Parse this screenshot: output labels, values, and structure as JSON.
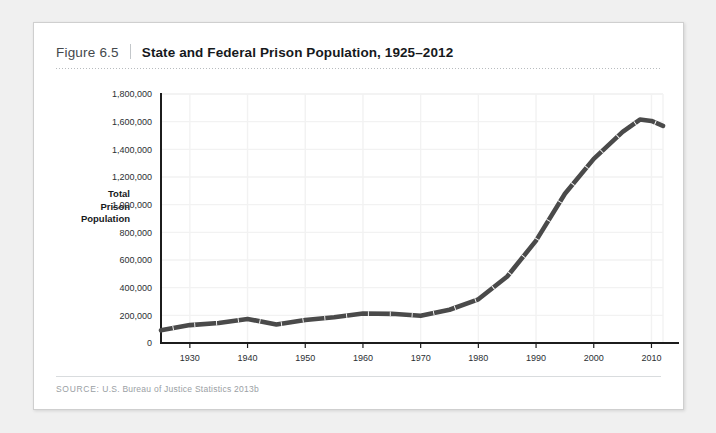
{
  "figure": {
    "number": "Figure 6.5",
    "title": "State and Federal Prison Population, 1925–2012",
    "source_label": "SOURCE:",
    "source_text": " U.S. Bureau of Justice Statistics 2013b"
  },
  "colors": {
    "line": "#4a4a4a",
    "axis": "#1c1c1c",
    "gridline": "#f2f2f2",
    "card_bg": "#ffffff",
    "page_bg": "#f0f0f0",
    "title_text": "#16191c",
    "figure_number_text": "#44484c",
    "source_text": "#9aa0a4"
  },
  "chart_data": {
    "type": "line",
    "title": "State and Federal Prison Population, 1925–2012",
    "xlabel": "",
    "ylabel": "Total Prison Population",
    "xlim": [
      1925,
      2012
    ],
    "ylim": [
      0,
      1800000
    ],
    "grid": true,
    "legend": "none",
    "xticks": [
      1930,
      1940,
      1950,
      1960,
      1970,
      1980,
      1990,
      2000,
      2010
    ],
    "xtick_labels": [
      "1930",
      "1940",
      "1950",
      "1960",
      "1970",
      "1980",
      "1990",
      "2000",
      "2010"
    ],
    "yticks": [
      0,
      200000,
      400000,
      600000,
      800000,
      1000000,
      1200000,
      1400000,
      1600000,
      1800000
    ],
    "ytick_labels": [
      "0",
      "200,000",
      "400,000",
      "600,000",
      "800,000",
      "1,000,000",
      "1,200,000",
      "1,400,000",
      "1,600,000",
      "1,800,000"
    ],
    "series": [
      {
        "name": "Total Prison Population",
        "x": [
          1925,
          1930,
          1935,
          1940,
          1945,
          1950,
          1955,
          1960,
          1965,
          1970,
          1975,
          1980,
          1985,
          1990,
          1995,
          2000,
          2005,
          2008,
          2010,
          2012
        ],
        "values": [
          91669,
          129453,
          144180,
          173706,
          133649,
          166123,
          185780,
          212953,
          210895,
          196429,
          240593,
          315974,
          480568,
          739980,
          1078542,
          1331278,
          1525910,
          1615487,
          1605127,
          1570397
        ]
      }
    ]
  }
}
